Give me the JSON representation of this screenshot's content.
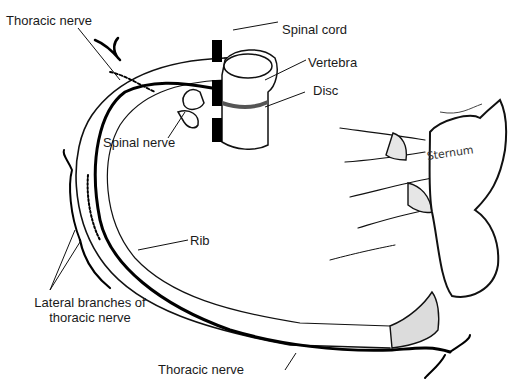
{
  "diagram": {
    "labels": {
      "thoracic_nerve_top": "Thoracic nerve",
      "spinal_cord": "Spinal cord",
      "vertebra": "Vertebra",
      "disc": "Disc",
      "spinal_nerve": "Spinal nerve",
      "sternum": "Sternum",
      "rib": "Rib",
      "lateral_branches_line1": "Lateral branches of",
      "lateral_branches_line2": "thoracic nerve",
      "thoracic_nerve_bottom": "Thoracic nerve"
    },
    "colors": {
      "outline": "#111111",
      "nerve": "#000000",
      "disc": "#555555",
      "cartilage_fill": "#dcdcdc",
      "background": "#ffffff"
    }
  }
}
